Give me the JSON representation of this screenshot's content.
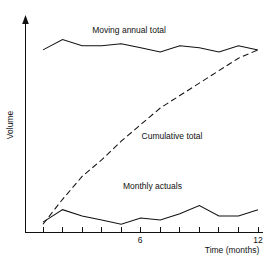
{
  "chart_data": {
    "type": "line",
    "title": "",
    "xlabel": "Time (months)",
    "ylabel": "Volume",
    "xlim": [
      0,
      12
    ],
    "ylim": [
      0,
      100
    ],
    "grid": false,
    "legend_position": "inline-annotations",
    "xticks": [
      1,
      2,
      3,
      4,
      5,
      6,
      7,
      8,
      9,
      10,
      11,
      12
    ],
    "xtick_labels": [
      "",
      "",
      "",
      "",
      "",
      "6",
      "",
      "",
      "",
      "",
      "",
      "12"
    ],
    "ytick_labels": [],
    "x": [
      1,
      2,
      3,
      4,
      5,
      6,
      7,
      8,
      9,
      10,
      11,
      12
    ],
    "series": [
      {
        "name": "Moving annual total",
        "style": "solid",
        "values": [
          88,
          93,
          90,
          90,
          91,
          89,
          87,
          90,
          89,
          87,
          90,
          88
        ]
      },
      {
        "name": "Cumulative total",
        "style": "dashed",
        "values": [
          4,
          16,
          27,
          35,
          44,
          52,
          60,
          66,
          72,
          78,
          84,
          88
        ]
      },
      {
        "name": "Monthly actuals",
        "style": "solid",
        "values": [
          5,
          11,
          8,
          6,
          4,
          7,
          6,
          9,
          13,
          8,
          8,
          11
        ]
      }
    ],
    "annotations": [
      {
        "text": "Moving annual total",
        "x": 5.4,
        "y": 96
      },
      {
        "text": "Cumulative total",
        "x": 7.6,
        "y": 45
      },
      {
        "text": "Monthly actuals",
        "x": 6.6,
        "y": 21
      }
    ]
  },
  "axes": {
    "y_axis_title": "Volume",
    "x_axis_title": "Time (months)",
    "x_label_mid": "6",
    "x_label_end": "12"
  },
  "colors": {
    "ink": "#111111",
    "background": "#ffffff"
  }
}
